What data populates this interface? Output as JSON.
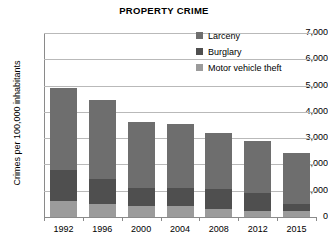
{
  "chart_data": {
    "type": "bar",
    "subtype": "stacked-bar",
    "title": "PROPERTY CRIME",
    "subtitle": "",
    "xlabel": "",
    "ylabel": "Crimes per 100,000 inhabitants",
    "categories": [
      "1992",
      "1996",
      "2000",
      "2004",
      "2008",
      "2012",
      "2015"
    ],
    "series": [
      {
        "name": "Motor vehicle theft",
        "color": "#9b9b9b",
        "values": [
          610,
          500,
          410,
          420,
          310,
          230,
          220
        ]
      },
      {
        "name": "Burglary",
        "color": "#4f4f4f",
        "values": [
          1180,
          950,
          690,
          690,
          740,
          680,
          270
        ]
      },
      {
        "name": "Larceny",
        "color": "#6e6e6e",
        "values": [
          3110,
          3000,
          2520,
          2410,
          2160,
          1980,
          1960
        ]
      }
    ],
    "stack_order_bottom_to_top": [
      "Motor vehicle theft",
      "Burglary",
      "Larceny"
    ],
    "totals": [
      4900,
      4450,
      3620,
      3520,
      3210,
      2890,
      2450
    ],
    "ylim": [
      0,
      7000
    ],
    "ytick_values": [
      0,
      1000,
      2000,
      3000,
      4000,
      5000,
      6000,
      7000
    ],
    "ytick_labels": [
      "0",
      "1,000",
      "2,000",
      "3,000",
      "4,000",
      "5,000",
      "6,000",
      "7,000"
    ],
    "grid": true,
    "grid_axis": "y",
    "legend_position": "top-right",
    "legend": [
      {
        "label": "Larceny",
        "color": "#6e6e6e",
        "swatch": "legend-swatch-larceny"
      },
      {
        "label": "Burglary",
        "color": "#4f4f4f",
        "swatch": "legend-swatch-burglary"
      },
      {
        "label": "Motor vehicle theft",
        "color": "#9b9b9b",
        "swatch": "legend-swatch-motor-vehicle-theft"
      }
    ],
    "colors": {
      "larceny": "#6e6e6e",
      "burglary": "#4f4f4f",
      "motor_vehicle_theft": "#9b9b9b",
      "gridline": "#b9b9b9",
      "axis": "#8a8a8a",
      "background": "#ffffff",
      "text": "#000000"
    }
  }
}
